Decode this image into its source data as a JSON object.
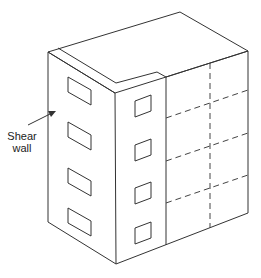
{
  "figure": {
    "annotation": {
      "line1": "Shear",
      "line2": "wall"
    }
  },
  "building": {
    "left_wall_windows": 4,
    "right_wall_windows": 4,
    "floors": 4,
    "colors": {
      "stroke": "#333333",
      "background": "#ffffff"
    }
  }
}
